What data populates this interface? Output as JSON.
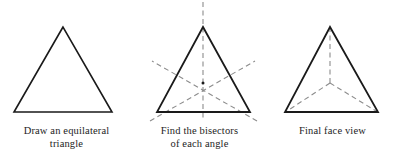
{
  "figure": {
    "background_color": "#ffffff",
    "line_color": "#1a1a1a",
    "dashed_color": "#8c8c8c",
    "width": 399,
    "height": 164
  },
  "panels": [
    {
      "id": "draw-equilateral-triangle",
      "caption_line_1": "Draw an equilateral",
      "caption_line_2": "triangle",
      "shape": "equilateral-triangle",
      "solid_triangle": {
        "apex": [
          63,
          27
        ],
        "bottom_left": [
          14,
          112
        ],
        "bottom_right": [
          112,
          112
        ]
      },
      "dashed_lines": [],
      "center_mark": null
    },
    {
      "id": "find-the-bisectors",
      "caption_line_1": "Find the bisectors",
      "caption_line_2": "of each angle",
      "shape": "equilateral-triangle-with-angle-bisectors",
      "solid_triangle": {
        "apex": [
          70,
          27
        ],
        "bottom_left": [
          24,
          112
        ],
        "bottom_right": [
          117,
          112
        ]
      },
      "dashed_lines": [
        {
          "name": "vertical-bisector-from-apex",
          "from": [
            70,
            2
          ],
          "to": [
            70,
            121
          ]
        },
        {
          "name": "bisector-from-bottom-left",
          "from": [
            17,
            121
          ],
          "to": [
            122,
            61
          ]
        },
        {
          "name": "bisector-from-bottom-right",
          "from": [
            124,
            121
          ],
          "to": [
            19,
            61
          ]
        }
      ],
      "center_mark": [
        70,
        83
      ]
    },
    {
      "id": "final-face-view",
      "caption_line_1": "Final face view",
      "caption_line_2": "",
      "shape": "equilateral-triangle-with-centroid-spokes",
      "solid_triangle": {
        "apex": [
          64,
          27
        ],
        "bottom_left": [
          19,
          112
        ],
        "bottom_right": [
          112,
          112
        ]
      },
      "dashed_lines": [
        {
          "name": "spoke-to-apex",
          "from": [
            64,
            83
          ],
          "to": [
            64,
            29
          ]
        },
        {
          "name": "spoke-to-bottom-left",
          "from": [
            64,
            83
          ],
          "to": [
            21,
            111
          ]
        },
        {
          "name": "spoke-to-bottom-right",
          "from": [
            64,
            83
          ],
          "to": [
            110,
            111
          ]
        }
      ],
      "center_mark": null
    }
  ]
}
